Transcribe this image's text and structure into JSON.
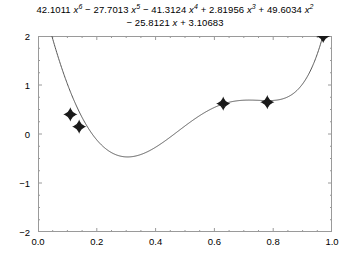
{
  "chart_data": {
    "type": "line",
    "title_lines": [
      {
        "terms": [
          {
            "coef": "42.1011",
            "var": "x",
            "exp": "6",
            "sign": ""
          },
          {
            "coef": "27.7013",
            "var": "x",
            "exp": "5",
            "sign": "−"
          },
          {
            "coef": "41.3124",
            "var": "x",
            "exp": "4",
            "sign": "−"
          },
          {
            "coef": "2.81956",
            "var": "x",
            "exp": "3",
            "sign": "+"
          },
          {
            "coef": "49.6034",
            "var": "x",
            "exp": "2",
            "sign": "+"
          }
        ]
      },
      {
        "terms": [
          {
            "coef": "25.8121",
            "var": "x",
            "exp": "",
            "sign": "−"
          },
          {
            "coef": "3.10683",
            "var": "",
            "exp": "",
            "sign": "+"
          }
        ]
      }
    ],
    "xlabel": "",
    "ylabel": "",
    "xlim": [
      0.0,
      1.0
    ],
    "ylim": [
      -2.0,
      2.0
    ],
    "grid": false,
    "legend": "none",
    "xticks": [
      "0.0",
      "0.2",
      "0.4",
      "0.6",
      "0.8",
      "1.0"
    ],
    "xtick_values": [
      0.0,
      0.2,
      0.4,
      0.6,
      0.8,
      1.0
    ],
    "yticks": [
      "2",
      "1",
      "0",
      "−1",
      "−2"
    ],
    "ytick_values": [
      2,
      1,
      0,
      -1,
      -2
    ],
    "polynomial": {
      "degree": 6,
      "coefficients": [
        42.1011,
        -27.7013,
        -41.3124,
        2.81956,
        49.6034,
        -25.8121,
        3.10683
      ],
      "coefficient_order": "descending",
      "domain": [
        0.0,
        0.98
      ]
    },
    "series": [
      {
        "name": "fitted-curve",
        "type": "line",
        "color": "#555555",
        "linewidth": 1
      },
      {
        "name": "data-points",
        "type": "scatter",
        "marker": "four-pointed-star",
        "color": "#1a1a1a",
        "x": [
          0.11,
          0.14,
          0.63,
          0.78,
          0.97
        ],
        "y": [
          0.4,
          0.15,
          0.62,
          0.65,
          2.0
        ]
      }
    ]
  },
  "figure": {
    "background_color": "#ffffff",
    "frame_color": "#9a9a9a",
    "text_color": "#000000"
  }
}
